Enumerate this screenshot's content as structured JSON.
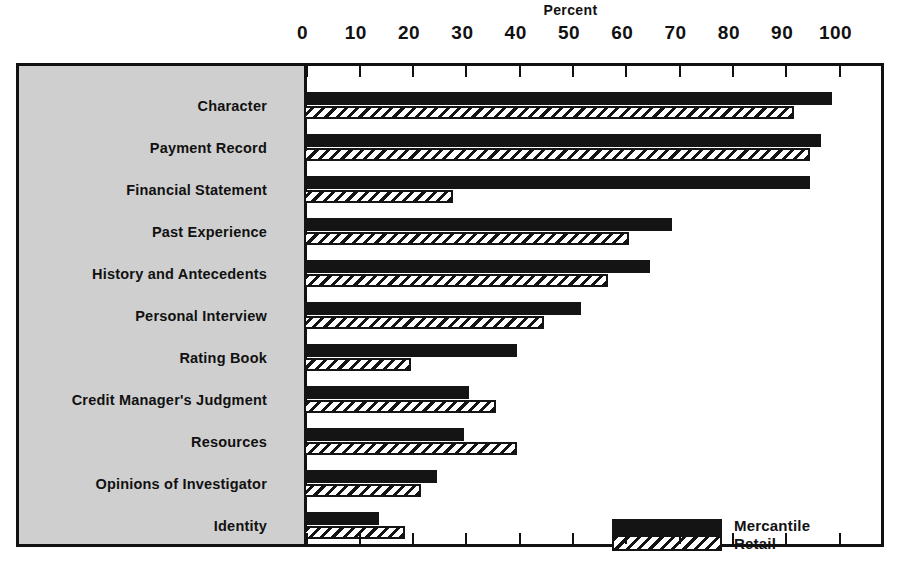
{
  "chart_data": {
    "type": "bar",
    "orientation": "horizontal",
    "title": "Percent",
    "xlabel": "Percent",
    "ylabel": "",
    "xlim": [
      0,
      100
    ],
    "xticks": [
      0,
      10,
      20,
      30,
      40,
      50,
      60,
      70,
      80,
      90,
      100
    ],
    "grid": false,
    "legend_position": "inside-lower-right",
    "categories": [
      "Character",
      "Payment Record",
      "Financial Statement",
      "Past Experience",
      "History and Antecedents",
      "Personal Interview",
      "Rating Book",
      "Credit Manager's Judgment",
      "Resources",
      "Opinions of Investigator",
      "Identity"
    ],
    "series": [
      {
        "name": "Mercantile",
        "color": "#141414",
        "fill": "solid",
        "values": [
          99,
          97,
          95,
          69,
          65,
          52,
          40,
          31,
          30,
          25,
          14
        ]
      },
      {
        "name": "Retail",
        "color": "#141414",
        "fill": "diagonal-hatch",
        "values": [
          92,
          95,
          28,
          61,
          57,
          45,
          20,
          36,
          40,
          22,
          19
        ]
      }
    ]
  },
  "legend": {
    "entries": [
      {
        "label": "Mercantile"
      },
      {
        "label": "Retail"
      }
    ]
  },
  "colors": {
    "panel": "#cfcfcf",
    "ink": "#141414",
    "background": "#ffffff"
  }
}
